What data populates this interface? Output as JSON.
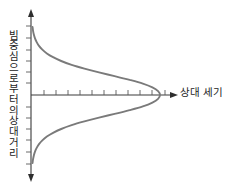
{
  "figure": {
    "background_color": "#ffffff",
    "axis_color": "#3a3a3a",
    "curve_color": "#7a7a7a",
    "tick_color": "#5a5a5a"
  },
  "labels": {
    "y_axis_full": "빔 중심으로부터의 상대 거리",
    "y_axis_chars": [
      "빔",
      "중",
      "심",
      "으",
      "로",
      "부",
      "터",
      "의",
      "상",
      "대",
      "거",
      "리"
    ],
    "x_axis": "상대 세기"
  },
  "chart_data": {
    "type": "line",
    "title": "",
    "subtitle": "",
    "xlabel": "상대 세기",
    "ylabel": "빔 중심으로부터의 상대 거리",
    "orientation": "horizontal-gaussian",
    "grid": false,
    "legend": false,
    "legend_entries": [],
    "annotations": [],
    "xlim": [
      0,
      1.05
    ],
    "ylim": [
      -1,
      1
    ],
    "x_tick_count": 11,
    "y_tick_count": 13,
    "axis_arrows": [
      "up",
      "down",
      "right"
    ],
    "series": [
      {
        "name": "빔 세기 분포",
        "x": [
          0.012,
          0.016,
          0.022,
          0.031,
          0.044,
          0.062,
          0.088,
          0.123,
          0.171,
          0.234,
          0.315,
          0.414,
          0.527,
          0.648,
          0.765,
          0.867,
          0.941,
          0.985,
          1.0,
          0.985,
          0.941,
          0.867,
          0.765,
          0.648,
          0.527,
          0.414,
          0.315,
          0.234,
          0.171,
          0.123,
          0.088,
          0.062,
          0.044,
          0.031,
          0.022,
          0.016,
          0.012
        ],
        "y": [
          1.0,
          0.944,
          0.889,
          0.833,
          0.778,
          0.722,
          0.667,
          0.611,
          0.556,
          0.5,
          0.444,
          0.389,
          0.333,
          0.278,
          0.222,
          0.167,
          0.111,
          0.056,
          0.0,
          -0.056,
          -0.111,
          -0.167,
          -0.222,
          -0.278,
          -0.333,
          -0.389,
          -0.444,
          -0.5,
          -0.556,
          -0.611,
          -0.667,
          -0.722,
          -0.778,
          -0.833,
          -0.889,
          -0.944,
          -1.0
        ]
      }
    ]
  }
}
